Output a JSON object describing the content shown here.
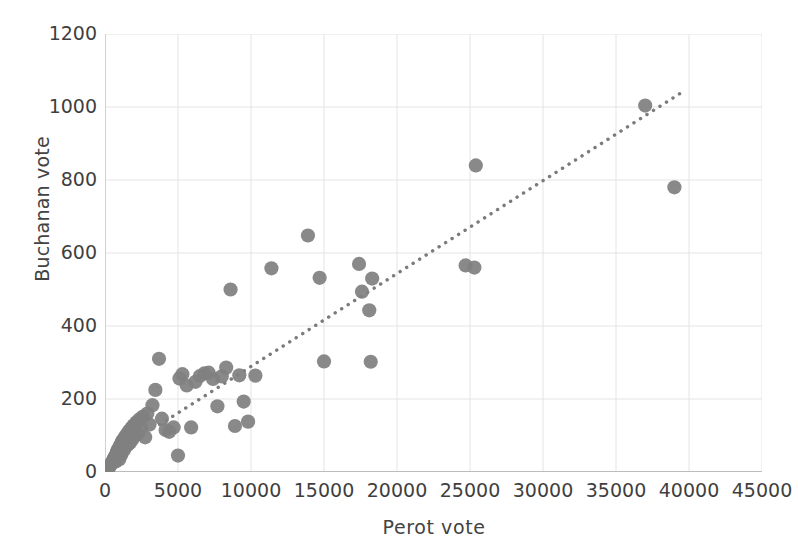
{
  "chart_data": {
    "type": "scatter",
    "title": "",
    "xlabel": "Perot  vote",
    "ylabel": "Buchanan vote",
    "xlim": [
      0,
      45000
    ],
    "ylim": [
      0,
      1200
    ],
    "xticks": [
      0,
      5000,
      10000,
      15000,
      20000,
      25000,
      30000,
      35000,
      40000,
      45000
    ],
    "yticks": [
      0,
      200,
      400,
      600,
      800,
      1000,
      1200
    ],
    "grid": true,
    "legend": "none",
    "marker_color": "#808080",
    "trendline_color": "#7b7b7b",
    "trendline_style": "dotted",
    "trendline": {
      "x_start": 3750,
      "y_start": 130,
      "x_end": 39500,
      "y_end": 1040
    },
    "x": [
      180,
      270,
      360,
      410,
      470,
      520,
      560,
      610,
      650,
      700,
      740,
      790,
      830,
      880,
      930,
      980,
      1030,
      1080,
      1120,
      1180,
      1240,
      1300,
      1360,
      1420,
      1500,
      1560,
      1640,
      1720,
      1800,
      1880,
      1960,
      2050,
      2150,
      2250,
      2350,
      2480,
      2600,
      2750,
      2900,
      3050,
      3250,
      3450,
      3700,
      3900,
      4150,
      4400,
      4700,
      5000,
      5100,
      5300,
      5600,
      5900,
      6200,
      6500,
      6800,
      7100,
      7400,
      7700,
      8000,
      8300,
      8600,
      8900,
      9200,
      9500,
      9800,
      10300,
      11400,
      13900,
      14700,
      15000,
      17400,
      17600,
      18100,
      18200,
      18300,
      24700,
      25300,
      25400,
      37000,
      39000
    ],
    "y": [
      9,
      13,
      17,
      22,
      25,
      29,
      33,
      36,
      40,
      44,
      29,
      52,
      56,
      60,
      64,
      35,
      72,
      76,
      47,
      84,
      88,
      60,
      96,
      70,
      104,
      75,
      112,
      80,
      120,
      90,
      128,
      100,
      136,
      105,
      144,
      122,
      152,
      95,
      160,
      130,
      183,
      225,
      310,
      146,
      115,
      110,
      122,
      45,
      256,
      268,
      237,
      122,
      247,
      263,
      270,
      272,
      255,
      180,
      262,
      286,
      500,
      126,
      265,
      193,
      138,
      264,
      558,
      648,
      532,
      303,
      570,
      494,
      443,
      302,
      530,
      566,
      560,
      840,
      1004,
      780
    ]
  }
}
